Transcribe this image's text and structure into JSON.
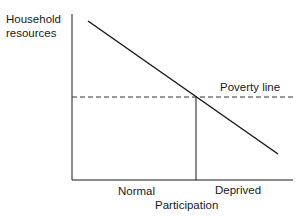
{
  "diagram": {
    "y_axis_label_line1": "Household",
    "y_axis_label_line2": "resources",
    "x_axis_label": "Participation",
    "x_region_left": "Normal",
    "x_region_right": "Deprived",
    "threshold_label": "Poverty line",
    "colors": {
      "line": "#1a1a1a",
      "dashed": "#333333",
      "text": "#1a1a1a"
    }
  }
}
